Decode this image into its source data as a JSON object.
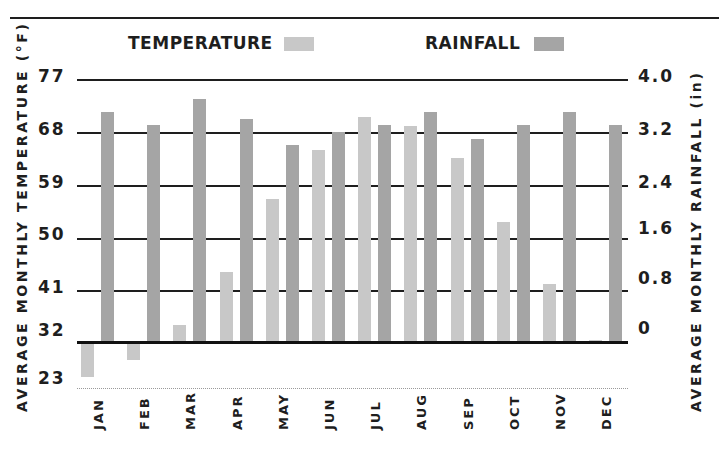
{
  "chart_data": {
    "type": "bar",
    "title": "",
    "legend": [
      {
        "name": "TEMPERATURE",
        "color": "#c8c8c8"
      },
      {
        "name": "RAINFALL",
        "color": "#a5a5a5"
      }
    ],
    "legend_position": "top",
    "categories": [
      "JAN",
      "FEB",
      "MAR",
      "APR",
      "MAY",
      "JUN",
      "JUL",
      "AUG",
      "SEP",
      "OCT",
      "NOV",
      "DEC"
    ],
    "series": [
      {
        "name": "TEMPERATURE",
        "axis": "left",
        "unit": "°F",
        "values": [
          26,
          29,
          35,
          44,
          56.5,
          65,
          70.5,
          69,
          63.5,
          52.5,
          42,
          32.3
        ]
      },
      {
        "name": "RAINFALL",
        "axis": "right",
        "unit": "in",
        "values": [
          3.5,
          3.3,
          3.7,
          3.4,
          3.0,
          3.2,
          3.3,
          3.5,
          3.1,
          3.3,
          3.5,
          3.3
        ]
      }
    ],
    "xlabel": "",
    "ylabel_left": "AVERAGE MONTHLY TEMPERATURE (°F)",
    "ylabel_right": "AVERAGE MONTHLY RAINFALL (in)",
    "yticks_left": [
      "77",
      "68",
      "59",
      "50",
      "41",
      "32",
      "23"
    ],
    "yticks_right": [
      "4.0",
      "3.2",
      "2.4",
      "1.6",
      "0.8",
      "0"
    ],
    "ylim_left": [
      23,
      77
    ],
    "ylim_right": [
      -0.7,
      4.0
    ],
    "grid": true,
    "baseline_left": 32,
    "baseline_right": 0
  },
  "legend": {
    "temperature_label": "TEMPERATURE",
    "rainfall_label": "RAINFALL",
    "temperature_color": "#c8c8c8",
    "rainfall_color": "#a5a5a5"
  },
  "axes": {
    "left_title": "AVERAGE MONTHLY TEMPERATURE (°F)",
    "right_title": "AVERAGE MONTHLY RAINFALL (in)",
    "left_ticks": [
      "77",
      "68",
      "59",
      "50",
      "41",
      "32",
      "23"
    ],
    "right_ticks": [
      "4.0",
      "3.2",
      "2.4",
      "1.6",
      "0.8",
      "0"
    ]
  },
  "months": [
    "JAN",
    "FEB",
    "MAR",
    "APR",
    "MAY",
    "JUN",
    "JUL",
    "AUG",
    "SEP",
    "OCT",
    "NOV",
    "DEC"
  ]
}
